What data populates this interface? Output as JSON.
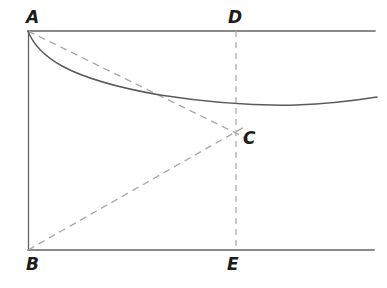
{
  "figure": {
    "type": "geometric-diagram",
    "background_color": "#ffffff",
    "solid_line_color": "#565656",
    "dashed_line_color": "#a8a8a8",
    "label_color": "#1c1c1c"
  },
  "labels": {
    "A": "A",
    "B": "B",
    "C": "C",
    "D": "D",
    "E": "E"
  },
  "geometry": {
    "points": {
      "A": [
        28,
        31
      ],
      "B": [
        28,
        250
      ],
      "C": [
        236,
        132
      ],
      "D": [
        236,
        31
      ],
      "E": [
        236,
        250
      ],
      "top_right": [
        375,
        31
      ],
      "bottom_right": [
        374,
        250
      ]
    },
    "solid_curve_points": [
      [
        28,
        31
      ],
      [
        40,
        48
      ],
      [
        56,
        61
      ],
      [
        80,
        74
      ],
      [
        110,
        84
      ],
      [
        148,
        92
      ],
      [
        190,
        99
      ],
      [
        240,
        103
      ],
      [
        290,
        105
      ],
      [
        320,
        103
      ],
      [
        350,
        100
      ],
      [
        376,
        97
      ]
    ],
    "dashed_segments": [
      {
        "name": "A-to-C",
        "from": [
          28,
          31
        ],
        "to": [
          247,
          138
        ]
      },
      {
        "name": "B-to-C",
        "from": [
          28,
          250
        ],
        "to": [
          245,
          126
        ]
      },
      {
        "name": "D-to-E",
        "from": [
          236,
          31
        ],
        "to": [
          236,
          250
        ]
      }
    ],
    "solid_segments": [
      {
        "name": "top-edge-AD",
        "from": [
          28,
          31
        ],
        "to": [
          375,
          31
        ]
      },
      {
        "name": "left-edge-AB",
        "from": [
          28,
          31
        ],
        "to": [
          28,
          250
        ]
      },
      {
        "name": "bottom-edge-BE",
        "from": [
          28,
          250
        ],
        "to": [
          374,
          250
        ]
      }
    ]
  }
}
